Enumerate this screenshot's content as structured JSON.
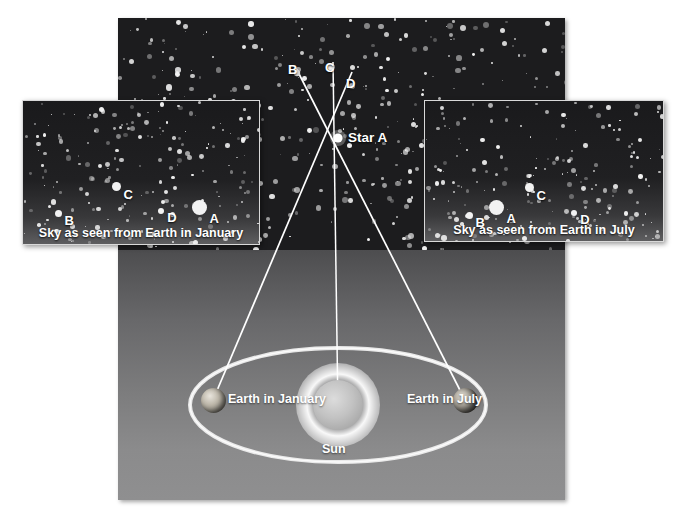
{
  "figure": {
    "type": "stellar-parallax-diagram",
    "background_color": "#ffffff"
  },
  "main_panel": {
    "name": "space-scene",
    "sky_color": "#1c1c1e",
    "labels": {
      "star_b": "B",
      "star_c": "C",
      "star_d": "D",
      "star_a": "Star A",
      "earth_january": "Earth\nin January",
      "earth_july": "Earth\nin July",
      "sun": "Sun"
    }
  },
  "inset_january": {
    "caption": "Sky as seen from Earth in January",
    "stars": [
      {
        "label": "B",
        "x": 35,
        "y": 112,
        "r": 3.5
      },
      {
        "label": "C",
        "x": 93,
        "y": 85,
        "r": 4.5
      },
      {
        "label": "D",
        "x": 138,
        "y": 110,
        "r": 3.2
      },
      {
        "label": "A",
        "x": 176,
        "y": 106,
        "r": 7.5
      }
    ]
  },
  "inset_july": {
    "caption": "Sky as seen from Earth in July",
    "stars": [
      {
        "label": "B",
        "x": 44,
        "y": 114,
        "r": 3.5
      },
      {
        "label": "A",
        "x": 71,
        "y": 106,
        "r": 7.5
      },
      {
        "label": "C",
        "x": 104,
        "y": 86,
        "r": 4.5
      },
      {
        "label": "D",
        "x": 149,
        "y": 112,
        "r": 3.2
      }
    ]
  },
  "chart_data": {
    "type": "diagram",
    "objects": [
      {
        "name": "Star A",
        "kind": "foreground-star",
        "x": 338,
        "y": 138
      },
      {
        "name": "B",
        "kind": "background-star",
        "x": 297,
        "y": 73
      },
      {
        "name": "C",
        "kind": "background-star",
        "x": 331,
        "y": 70
      },
      {
        "name": "D",
        "kind": "background-star",
        "x": 352,
        "y": 87
      },
      {
        "name": "Sun",
        "kind": "star",
        "x": 338,
        "y": 405
      },
      {
        "name": "Earth in January",
        "kind": "planet",
        "x": 213,
        "y": 400
      },
      {
        "name": "Earth in July",
        "kind": "planet",
        "x": 465,
        "y": 400
      }
    ],
    "sight_lines": [
      {
        "from": "Earth in January",
        "through": "Star A",
        "to": "D"
      },
      {
        "from": "Earth in July",
        "through": "Star A",
        "to": "B"
      },
      {
        "from": "Sun",
        "through": "Star A",
        "to": "C"
      }
    ],
    "legend": [
      "Sky as seen from Earth in January",
      "Sky as seen from Earth in July"
    ]
  }
}
